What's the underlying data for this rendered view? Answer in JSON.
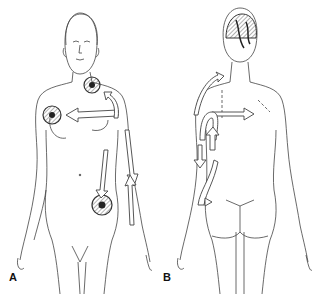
{
  "figure": {
    "panels": [
      {
        "label": "A",
        "view": "anterior",
        "description": "Front view of female figure with lesion circles at neck, breast and groin; arrows showing lymphatic drainage directions"
      },
      {
        "label": "B",
        "view": "posterior",
        "description": "Back view of female figure with lesion on scalp; arrows showing drainage across back and down arm"
      }
    ],
    "colors": {
      "line": "#333333",
      "arrow_fill": "#ffffff",
      "lesion_hatch": "#555555",
      "lesion_core": "#222222"
    }
  }
}
